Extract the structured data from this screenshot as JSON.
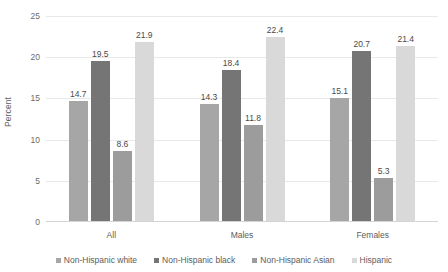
{
  "chart_data": {
    "type": "bar",
    "title": "",
    "subtitle": "",
    "xlabel": "",
    "ylabel": "Percent",
    "ylim": [
      0,
      25
    ],
    "yticks": [
      0,
      5,
      10,
      15,
      20,
      25
    ],
    "ytick_labels": [
      "0",
      "5",
      "10",
      "15",
      "20",
      "25"
    ],
    "grid": true,
    "grid_axis": "y",
    "legend_position": "bottom",
    "categories": [
      "All",
      "Males",
      "Females"
    ],
    "series": [
      {
        "name": "Non-Hispanic white",
        "color": "#a6a6a6",
        "values": [
          14.7,
          14.3,
          15.1
        ],
        "labels": [
          "14.7",
          "14.3",
          "15.1"
        ]
      },
      {
        "name": "Non-Hispanic black",
        "color": "#757575",
        "values": [
          19.5,
          18.4,
          20.7
        ],
        "labels": [
          "19.5",
          "18.4",
          "20.7"
        ]
      },
      {
        "name": "Non-Hispanic Asian",
        "color": "#9c9c9c",
        "values": [
          8.6,
          11.8,
          5.3
        ],
        "labels": [
          "8.6",
          "11.8",
          "5.3"
        ]
      },
      {
        "name": "Hispanic",
        "color": "#d9d9d9",
        "values": [
          21.9,
          22.4,
          21.4
        ],
        "labels": [
          "21.9",
          "22.4",
          "21.4"
        ]
      }
    ]
  },
  "colors": {
    "background": "#ffffff",
    "gridline": "#e8e8e8",
    "axis_text": "#5d5d5d",
    "data_label_text": "#4a4a4a"
  }
}
